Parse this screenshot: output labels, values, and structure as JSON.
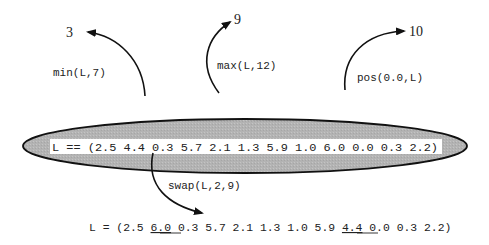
{
  "diagram": {
    "list_expression": "L == (2.5 4.4 0.3 5.7 2.1 1.3 5.9 1.0 6.0 0.0 0.3 2.2)",
    "operations": [
      {
        "call": "min(L,7)",
        "result": "3"
      },
      {
        "call": "max(L,12)",
        "result": "9"
      },
      {
        "call": "pos(0.0,L)",
        "result": "10"
      }
    ],
    "swap": {
      "call": "swap(L,2,9)",
      "result_prefix": "L = (2.5 ",
      "swapped_first": "6.0",
      "result_middle": " 0.3 5.7 2.1 1.3 1.0 5.9 ",
      "swapped_second": "4.4",
      "result_suffix": " 0.0 0.3 2.2)"
    },
    "colors": {
      "ellipse_fill": "#b5b5b5",
      "ellipse_stroke": "#111111",
      "label_bg": "#ffffff",
      "arrow": "#111111"
    }
  }
}
